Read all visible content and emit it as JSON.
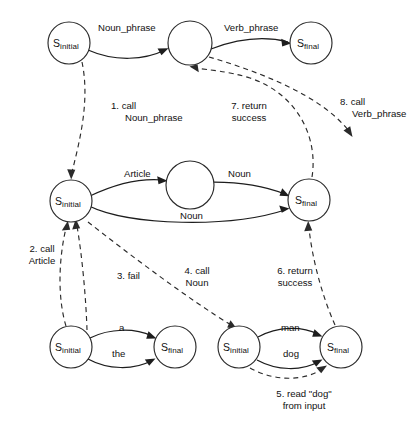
{
  "diagram": {
    "states": [
      {
        "id": "top-initial",
        "name": "S",
        "sub": "initial",
        "cx": 69,
        "cy": 43,
        "r": 21
      },
      {
        "id": "top-middle",
        "name": "",
        "sub": "",
        "cx": 190,
        "cy": 43,
        "r": 22
      },
      {
        "id": "top-final",
        "name": "S",
        "sub": "final",
        "cx": 311,
        "cy": 43,
        "r": 21
      },
      {
        "id": "mid-initial",
        "name": "S",
        "sub": "initial",
        "cx": 71,
        "cy": 201,
        "r": 21
      },
      {
        "id": "mid-middle",
        "name": "",
        "sub": "",
        "cx": 190,
        "cy": 185,
        "r": 24
      },
      {
        "id": "mid-final",
        "name": "S",
        "sub": "final",
        "cx": 309,
        "cy": 200,
        "r": 21
      },
      {
        "id": "bl-initial",
        "name": "S",
        "sub": "initial",
        "cx": 71,
        "cy": 347,
        "r": 21
      },
      {
        "id": "bl-final",
        "name": "S",
        "sub": "final",
        "cx": 175,
        "cy": 347,
        "r": 21
      },
      {
        "id": "br-initial",
        "name": "S",
        "sub": "initial",
        "cx": 239,
        "cy": 347,
        "r": 21
      },
      {
        "id": "br-final",
        "name": "S",
        "sub": "final",
        "cx": 341,
        "cy": 347,
        "r": 21
      }
    ],
    "edge_labels": [
      {
        "id": "noun-phrase",
        "text": "Noun_phrase",
        "x": 98,
        "y": 22
      },
      {
        "id": "verb-phrase",
        "text": "Verb_phrase",
        "x": 224,
        "y": 22
      },
      {
        "id": "article",
        "text": "Article",
        "x": 124,
        "y": 168
      },
      {
        "id": "noun-upper",
        "text": "Noun",
        "x": 228,
        "y": 168
      },
      {
        "id": "noun-lower",
        "text": "Noun",
        "x": 180,
        "y": 210
      },
      {
        "id": "word-a",
        "text": "a",
        "x": 119,
        "y": 324
      },
      {
        "id": "word-the",
        "text": "the",
        "x": 112,
        "y": 350
      },
      {
        "id": "word-man",
        "text": "man",
        "x": 281,
        "y": 324
      },
      {
        "id": "word-dog",
        "text": "dog",
        "x": 283,
        "y": 350
      }
    ],
    "step_labels": [
      {
        "id": "step-1",
        "line1": "1. call",
        "line2": "Noun_phrase",
        "x": 111,
        "y": 100,
        "align": "left"
      },
      {
        "id": "step-7",
        "line1": "7. return",
        "line2": "success",
        "x": 222,
        "y": 100,
        "align": "center"
      },
      {
        "id": "step-8",
        "line1": "8. call",
        "line2": "Verb_phrase",
        "x": 340,
        "y": 96,
        "align": "left"
      },
      {
        "id": "step-2",
        "line1": "2. call",
        "line2": "Article",
        "x": 18,
        "y": 243,
        "align": "center"
      },
      {
        "id": "step-3",
        "line1": "3. fail",
        "line2": "",
        "x": 117,
        "y": 270,
        "align": "left"
      },
      {
        "id": "step-4",
        "line1": "4. call",
        "line2": "Noun",
        "x": 173,
        "y": 265,
        "align": "center"
      },
      {
        "id": "step-6",
        "line1": "6. return",
        "line2": "success",
        "x": 268,
        "y": 265,
        "align": "center"
      },
      {
        "id": "step-5",
        "line1": "5. read \"dog\"",
        "line2": "from input",
        "x": 265,
        "y": 388,
        "align": "center"
      }
    ]
  }
}
